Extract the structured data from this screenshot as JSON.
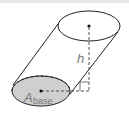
{
  "diagram": {
    "labels": {
      "height": "h",
      "area_main": "A",
      "area_sub": "base"
    },
    "colors": {
      "outline": "#222222",
      "base_fill": "#cfcfcf",
      "label": "#777777",
      "background": "#ffffff"
    }
  }
}
